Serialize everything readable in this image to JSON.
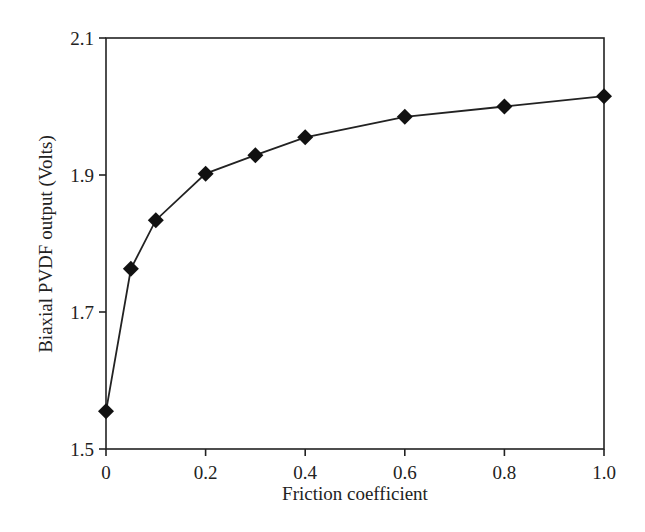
{
  "chart_data": {
    "type": "line",
    "title": "",
    "xlabel": "Friction coefficient",
    "ylabel": "Biaxial PVDF output (Volts)",
    "xlim": [
      0,
      1.0
    ],
    "ylim": [
      1.5,
      2.1
    ],
    "xticks": [
      0,
      0.2,
      0.4,
      0.6,
      0.8,
      1.0
    ],
    "xtick_labels": [
      "0",
      "0.2",
      "0.4",
      "0.6",
      "0.8",
      "1.0"
    ],
    "yticks": [
      1.5,
      1.7,
      1.9,
      2.1
    ],
    "ytick_labels": [
      "1.5",
      "1.7",
      "1.9",
      "2.1"
    ],
    "grid": false,
    "legend": null,
    "marker": "diamond",
    "series": [
      {
        "name": "Biaxial PVDF output",
        "color": "#111111",
        "x": [
          0,
          0.05,
          0.1,
          0.2,
          0.3,
          0.4,
          0.6,
          0.8,
          1.0
        ],
        "values": [
          1.555,
          1.763,
          1.834,
          1.902,
          1.929,
          1.955,
          1.985,
          2.0,
          2.015
        ]
      }
    ]
  }
}
